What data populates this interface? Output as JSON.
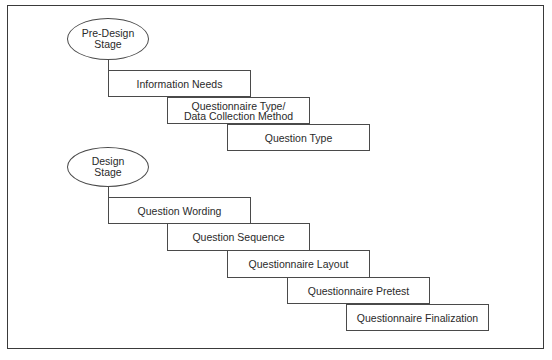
{
  "diagram": {
    "type": "staircase-process",
    "stages": [
      {
        "label": "Pre-Design\nStage",
        "steps": [
          {
            "label": "Information Needs"
          },
          {
            "label": "Questionnaire Type/\nData Collection Method"
          },
          {
            "label": "Question Type"
          }
        ]
      },
      {
        "label": "Design\nStage",
        "steps": [
          {
            "label": "Question Wording"
          },
          {
            "label": "Question Sequence"
          },
          {
            "label": "Questionnaire Layout"
          },
          {
            "label": "Questionnaire Pretest"
          },
          {
            "label": "Questionnaire Finalization"
          }
        ]
      }
    ]
  }
}
